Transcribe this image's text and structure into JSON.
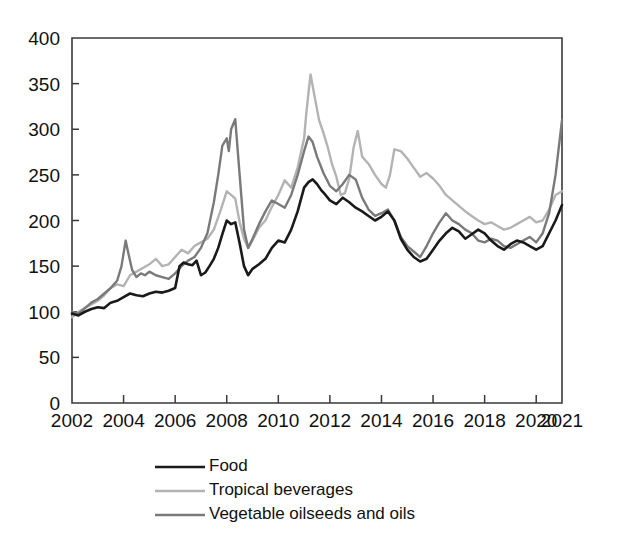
{
  "chart_data": {
    "type": "line",
    "title": "",
    "subtitle": "",
    "xlabel": "",
    "ylabel": "",
    "xlim": [
      2002,
      2021
    ],
    "ylim": [
      0,
      400
    ],
    "grid": false,
    "legend_position": "bottom",
    "y_ticks": [
      0,
      50,
      100,
      150,
      200,
      250,
      300,
      350,
      400
    ],
    "y_tick_labels": [
      "0",
      "50",
      "100",
      "150",
      "200",
      "250",
      "300",
      "350",
      "400"
    ],
    "x_ticks": [
      2002,
      2004,
      2006,
      2008,
      2010,
      2012,
      2014,
      2016,
      2018,
      2020,
      2021
    ],
    "x_tick_labels": [
      "2002",
      "2004",
      "2006",
      "2008",
      "2010",
      "2012",
      "2014",
      "2016",
      "2018",
      "2020",
      "2021"
    ],
    "series": [
      {
        "name": "Food",
        "color": "#1a1a1a",
        "width": 2.6,
        "x": [
          2002.0,
          2002.25,
          2002.5,
          2002.75,
          2003.0,
          2003.25,
          2003.5,
          2003.75,
          2004.0,
          2004.25,
          2004.5,
          2004.75,
          2005.0,
          2005.25,
          2005.5,
          2005.75,
          2006.0,
          2006.17,
          2006.33,
          2006.5,
          2006.67,
          2006.83,
          2007.0,
          2007.17,
          2007.33,
          2007.5,
          2007.67,
          2007.83,
          2008.0,
          2008.17,
          2008.33,
          2008.5,
          2008.67,
          2008.83,
          2009.0,
          2009.25,
          2009.5,
          2009.75,
          2010.0,
          2010.25,
          2010.5,
          2010.75,
          2011.0,
          2011.17,
          2011.33,
          2011.5,
          2011.67,
          2011.83,
          2012.0,
          2012.25,
          2012.5,
          2012.75,
          2013.0,
          2013.25,
          2013.5,
          2013.75,
          2014.0,
          2014.25,
          2014.5,
          2014.75,
          2015.0,
          2015.25,
          2015.5,
          2015.75,
          2016.0,
          2016.25,
          2016.5,
          2016.75,
          2017.0,
          2017.25,
          2017.5,
          2017.75,
          2018.0,
          2018.25,
          2018.5,
          2018.75,
          2019.0,
          2019.25,
          2019.5,
          2019.75,
          2020.0,
          2020.25,
          2020.5,
          2020.75,
          2021.0
        ],
        "values": [
          98,
          96,
          100,
          103,
          105,
          104,
          110,
          112,
          116,
          120,
          118,
          117,
          120,
          122,
          121,
          123,
          126,
          150,
          154,
          152,
          151,
          156,
          140,
          143,
          150,
          158,
          170,
          185,
          200,
          196,
          198,
          175,
          150,
          140,
          147,
          152,
          158,
          170,
          178,
          176,
          190,
          210,
          236,
          242,
          245,
          240,
          233,
          228,
          222,
          218,
          225,
          220,
          214,
          210,
          205,
          200,
          204,
          210,
          200,
          180,
          168,
          160,
          155,
          158,
          168,
          178,
          186,
          192,
          188,
          180,
          185,
          190,
          186,
          178,
          172,
          168,
          174,
          178,
          176,
          172,
          168,
          172,
          186,
          200,
          217
        ]
      },
      {
        "name": "Tropical beverages",
        "color": "#b3b3b3",
        "width": 2.4,
        "x": [
          2002.0,
          2002.25,
          2002.5,
          2002.75,
          2003.0,
          2003.25,
          2003.5,
          2003.75,
          2004.0,
          2004.25,
          2004.5,
          2004.75,
          2005.0,
          2005.25,
          2005.5,
          2005.75,
          2006.0,
          2006.25,
          2006.5,
          2006.75,
          2007.0,
          2007.25,
          2007.5,
          2007.75,
          2008.0,
          2008.17,
          2008.33,
          2008.5,
          2008.67,
          2008.83,
          2009.0,
          2009.25,
          2009.5,
          2009.75,
          2010.0,
          2010.25,
          2010.5,
          2010.75,
          2011.0,
          2011.08,
          2011.17,
          2011.25,
          2011.42,
          2011.58,
          2011.75,
          2011.92,
          2012.08,
          2012.25,
          2012.42,
          2012.58,
          2012.75,
          2012.92,
          2013.08,
          2013.25,
          2013.5,
          2013.75,
          2014.0,
          2014.17,
          2014.33,
          2014.5,
          2014.75,
          2015.0,
          2015.25,
          2015.5,
          2015.75,
          2016.0,
          2016.25,
          2016.5,
          2016.75,
          2017.0,
          2017.25,
          2017.5,
          2017.75,
          2018.0,
          2018.25,
          2018.5,
          2018.75,
          2019.0,
          2019.25,
          2019.5,
          2019.75,
          2020.0,
          2020.25,
          2020.5,
          2020.75,
          2021.0
        ],
        "values": [
          94,
          100,
          104,
          108,
          112,
          118,
          126,
          130,
          128,
          140,
          144,
          148,
          152,
          158,
          150,
          152,
          160,
          168,
          164,
          172,
          176,
          180,
          190,
          210,
          232,
          228,
          224,
          198,
          180,
          170,
          178,
          192,
          200,
          215,
          228,
          244,
          236,
          258,
          290,
          316,
          340,
          360,
          334,
          310,
          296,
          280,
          262,
          248,
          228,
          230,
          246,
          280,
          298,
          270,
          262,
          250,
          240,
          236,
          250,
          278,
          276,
          268,
          258,
          248,
          252,
          246,
          238,
          228,
          222,
          216,
          210,
          205,
          200,
          196,
          198,
          194,
          190,
          192,
          196,
          200,
          204,
          198,
          200,
          212,
          228,
          232
        ]
      },
      {
        "name": "Vegetable oilseeds and oils",
        "color": "#7a7a7a",
        "width": 2.4,
        "x": [
          2002.0,
          2002.25,
          2002.5,
          2002.75,
          2003.0,
          2003.25,
          2003.5,
          2003.75,
          2003.92,
          2004.08,
          2004.17,
          2004.33,
          2004.5,
          2004.67,
          2004.83,
          2005.0,
          2005.25,
          2005.5,
          2005.75,
          2006.0,
          2006.25,
          2006.5,
          2006.75,
          2007.0,
          2007.25,
          2007.5,
          2007.67,
          2007.83,
          2008.0,
          2008.08,
          2008.17,
          2008.33,
          2008.5,
          2008.67,
          2008.83,
          2009.0,
          2009.25,
          2009.5,
          2009.75,
          2010.0,
          2010.25,
          2010.5,
          2010.75,
          2011.0,
          2011.17,
          2011.33,
          2011.5,
          2011.75,
          2012.0,
          2012.25,
          2012.5,
          2012.75,
          2013.0,
          2013.25,
          2013.5,
          2013.75,
          2014.0,
          2014.25,
          2014.5,
          2014.75,
          2015.0,
          2015.25,
          2015.5,
          2015.75,
          2016.0,
          2016.25,
          2016.5,
          2016.75,
          2017.0,
          2017.25,
          2017.5,
          2017.75,
          2018.0,
          2018.25,
          2018.5,
          2018.75,
          2019.0,
          2019.25,
          2019.5,
          2019.75,
          2020.0,
          2020.25,
          2020.5,
          2020.75,
          2021.0
        ],
        "values": [
          100,
          98,
          104,
          110,
          114,
          120,
          126,
          134,
          150,
          178,
          166,
          146,
          138,
          142,
          140,
          144,
          140,
          138,
          136,
          142,
          150,
          156,
          160,
          170,
          186,
          220,
          250,
          282,
          290,
          276,
          300,
          311,
          250,
          190,
          170,
          180,
          196,
          210,
          222,
          218,
          214,
          228,
          250,
          276,
          292,
          286,
          270,
          252,
          238,
          232,
          240,
          250,
          245,
          225,
          212,
          205,
          208,
          212,
          200,
          182,
          172,
          166,
          160,
          172,
          186,
          198,
          208,
          200,
          196,
          190,
          186,
          178,
          176,
          180,
          178,
          172,
          170,
          174,
          178,
          182,
          176,
          186,
          208,
          250,
          310
        ]
      }
    ]
  },
  "legend": {
    "items": [
      {
        "label": "Food"
      },
      {
        "label": "Tropical beverages"
      },
      {
        "label": "Vegetable oilseeds and oils"
      }
    ]
  }
}
